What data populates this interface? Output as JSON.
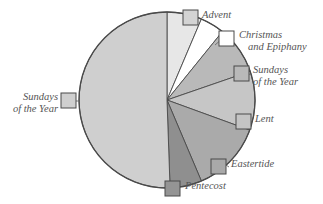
{
  "chart_data": {
    "type": "pie",
    "title": "",
    "subtitle": "",
    "xlabel": "",
    "ylabel": "",
    "legend_position": "callout-labels",
    "grid": false,
    "center": {
      "x": 167,
      "y": 100
    },
    "radius": 88,
    "start_angle_deg": 0,
    "direction": "clockwise",
    "categories": [
      "Advent",
      "Christmas and Epiphany",
      "Sundays of the Year",
      "Lent",
      "Eastertide",
      "Pentecost",
      "Sundays of the Year"
    ],
    "values": [
      6.5,
      4.5,
      9.0,
      11.0,
      13.0,
      6.0,
      50.0
    ],
    "units": "percent of liturgical year",
    "colors": [
      "#e7e7e7",
      "#ffffff",
      "#b9b9b9",
      "#c6c6c6",
      "#aaaaaa",
      "#8f8f8f",
      "#cfcfcf"
    ],
    "slice_angles_deg": [
      {
        "name": "Advent",
        "start": 0,
        "end": 23
      },
      {
        "name": "Christmas and Epiphany",
        "start": 23,
        "end": 39
      },
      {
        "name": "Sundays of the Year",
        "start": 39,
        "end": 71
      },
      {
        "name": "Lent",
        "start": 71,
        "end": 110
      },
      {
        "name": "Eastertide",
        "start": 110,
        "end": 157
      },
      {
        "name": "Pentecost",
        "start": 157,
        "end": 178
      },
      {
        "name": "Sundays of the Year",
        "start": 178,
        "end": 360
      }
    ],
    "outline_color": "#4a4a4a"
  },
  "labels": {
    "advent": {
      "text": "Advent",
      "swatch_color": "#d3d3d3"
    },
    "christmas": {
      "line1": "Christmas",
      "line2": "and Epiphany",
      "swatch_color": "#ffffff"
    },
    "sundays_right": {
      "line1": "Sundays",
      "line2": "of the Year",
      "swatch_color": "#b9b9b9"
    },
    "lent": {
      "text": "Lent",
      "swatch_color": "#c4c4c4"
    },
    "eastertide": {
      "text": "Eastertide",
      "swatch_color": "#a9a9a9"
    },
    "pentecost": {
      "text": "Pentecost",
      "swatch_color": "#949494"
    },
    "sundays_left": {
      "line1": "Sundays",
      "line2": "of the Year",
      "swatch_color": "#cfcfcf"
    }
  }
}
